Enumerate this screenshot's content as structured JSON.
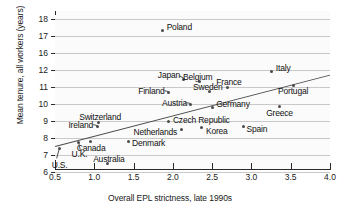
{
  "chart_data": {
    "type": "scatter",
    "title": "",
    "xlabel": "Overall EPL strictness, late 1990s",
    "ylabel": "Mean tenure, all workers (years)",
    "xlim": [
      0.5,
      4.0
    ],
    "xticks": [
      "0.5",
      "1.0",
      "1.5",
      "2.0",
      "2.5",
      "3.0",
      "3.5",
      "4.0"
    ],
    "yticks": [
      "18",
      "17",
      "16",
      "12",
      "11",
      "10",
      "9",
      "8",
      "7",
      "6"
    ],
    "y_axis_break": true,
    "y_axis_break_between": [
      16,
      12
    ],
    "grid": true,
    "legend": "none",
    "trendline": true,
    "points": [
      {
        "label": "Poland",
        "x": 1.87,
        "y": 17.3
      },
      {
        "label": "Italy",
        "x": 3.26,
        "y": 11.9
      },
      {
        "label": "Japan",
        "x": 2.14,
        "y": 11.45
      },
      {
        "label": "Belgium",
        "x": 2.34,
        "y": 11.3
      },
      {
        "label": "Portugal",
        "x": 3.53,
        "y": 11.1
      },
      {
        "label": "France",
        "x": 2.7,
        "y": 11.0
      },
      {
        "label": "Sweden",
        "x": 2.46,
        "y": 10.75
      },
      {
        "label": "Finland",
        "x": 1.94,
        "y": 10.7
      },
      {
        "label": "Austria",
        "x": 2.23,
        "y": 10.0
      },
      {
        "label": "Greece",
        "x": 3.36,
        "y": 9.85
      },
      {
        "label": "Germany",
        "x": 2.5,
        "y": 9.8
      },
      {
        "label": "Czech Republic",
        "x": 1.95,
        "y": 8.95
      },
      {
        "label": "Switzerland",
        "x": 1.05,
        "y": 8.9
      },
      {
        "label": "Ireland",
        "x": 1.04,
        "y": 8.7
      },
      {
        "label": "Spain",
        "x": 2.9,
        "y": 8.7
      },
      {
        "label": "Korea",
        "x": 2.37,
        "y": 8.6
      },
      {
        "label": "Netherlands",
        "x": 2.11,
        "y": 8.5
      },
      {
        "label": "Denmark",
        "x": 1.43,
        "y": 7.8
      },
      {
        "label": "Canada",
        "x": 0.95,
        "y": 7.8
      },
      {
        "label": "U.K.",
        "x": 0.8,
        "y": 7.75
      },
      {
        "label": "U.S.",
        "x": 0.56,
        "y": 7.4
      },
      {
        "label": "Australia",
        "x": 1.17,
        "y": 6.5
      }
    ]
  },
  "axes": {
    "y_title": "Mean tenure, all workers (years)",
    "x_title": "Overall EPL strictness, late 1990s"
  }
}
